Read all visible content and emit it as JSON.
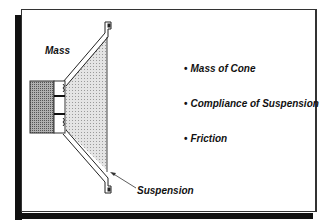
{
  "diagram": {
    "labels": {
      "mass": "Mass",
      "suspension": "Suspension"
    },
    "bullets": [
      {
        "marker": "•",
        "text": "Mass of Cone"
      },
      {
        "marker": "•",
        "text": "Compliance of Suspension"
      },
      {
        "marker": "•",
        "text": "Friction"
      }
    ],
    "colors": {
      "frame_border": "#333333",
      "shadow": "#111111",
      "cone_fill": "#d9d9d9",
      "magnet_fill": "#9a9a9a",
      "text": "#111111"
    }
  }
}
